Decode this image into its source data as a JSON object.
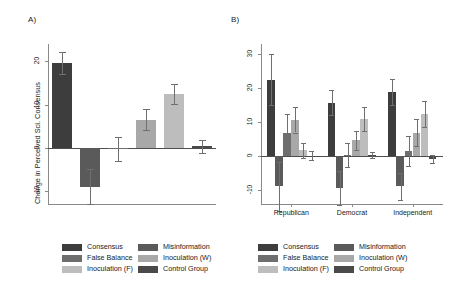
{
  "figure": {
    "panel_a_letter": "A)",
    "panel_b_letter": "B)"
  },
  "legend": {
    "items": [
      {
        "label": "Consensus",
        "color": "#3d3d3d"
      },
      {
        "label": "Misinformation",
        "color": "#5a5a5a"
      },
      {
        "label": "False Balance",
        "color": "#6e6e6e"
      },
      {
        "label": "Inoculation (W)",
        "color": "#a8a8a8"
      },
      {
        "label": "Inoculation (F)",
        "color": "#bdbdbd"
      },
      {
        "label": "Control Group",
        "color": "#4a4a4a"
      }
    ]
  },
  "chart_data": [
    {
      "id": "panel_a",
      "type": "bar",
      "title": "A)",
      "xlabel": "",
      "ylabel": "Change in Perceived Sci. Consensus",
      "ylim": [
        -13,
        24
      ],
      "yticks": [
        20,
        10,
        0,
        -10
      ],
      "ytick_labels": [
        "20",
        "10",
        "0",
        "-10"
      ],
      "grid": false,
      "legend_position": "below",
      "categories": [
        "Consensus",
        "Misinformation",
        "False Balance",
        "Inoculation (W)",
        "Inoculation (F)",
        "Control Group"
      ],
      "values": [
        19.6,
        -9.0,
        -0.3,
        6.5,
        12.5,
        0.3
      ],
      "errors": [
        2.6,
        4.0,
        2.8,
        2.4,
        2.3,
        1.6
      ],
      "colors": [
        "#3d3d3d",
        "#5a5a5a",
        "#6e6e6e",
        "#a8a8a8",
        "#bdbdbd",
        "#4a4a4a"
      ]
    },
    {
      "id": "panel_b",
      "type": "bar",
      "title": "B)",
      "xlabel": "",
      "ylabel": "",
      "ylim": [
        -14,
        33
      ],
      "yticks": [
        30,
        20,
        10,
        0,
        -10
      ],
      "ytick_labels": [
        "30",
        "20",
        "10",
        "0",
        "-10"
      ],
      "grid": false,
      "legend_position": "below",
      "categories": [
        "Republican",
        "Democrat",
        "Independent"
      ],
      "series": [
        {
          "name": "Consensus",
          "color": "#3d3d3d",
          "values": [
            22.5,
            15.8,
            19.0
          ],
          "errors": [
            7.5,
            3.6,
            3.8
          ]
        },
        {
          "name": "Misinformation",
          "color": "#5a5a5a",
          "values": [
            -8.8,
            -9.2,
            -8.8
          ],
          "errors": [
            7.2,
            5.0,
            4.0
          ]
        },
        {
          "name": "False Balance",
          "color": "#6e6e6e",
          "values": [
            6.8,
            0.3,
            1.7
          ],
          "errors": [
            5.5,
            3.5,
            4.4
          ]
        },
        {
          "name": "Inoculation (W)",
          "color": "#a8a8a8",
          "values": [
            10.8,
            4.7,
            7.0
          ],
          "errors": [
            3.8,
            2.8,
            4.1
          ]
        },
        {
          "name": "Inoculation (F)",
          "color": "#bdbdbd",
          "values": [
            1.8,
            11.0,
            12.5
          ],
          "errors": [
            2.2,
            3.6,
            3.8
          ]
        },
        {
          "name": "Control Group",
          "color": "#4a4a4a",
          "values": [
            0.2,
            0.4,
            -0.8
          ],
          "errors": [
            1.4,
            1.0,
            1.3
          ]
        }
      ]
    }
  ]
}
